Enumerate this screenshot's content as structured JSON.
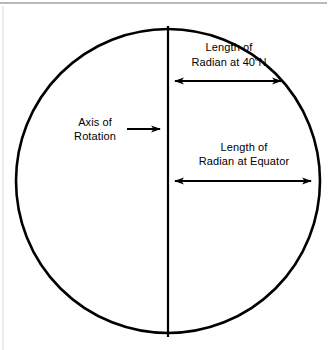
{
  "figure": {
    "background_color": "#ffffff",
    "stroke_color": "#000000",
    "top_rule_color": "#b9b9bd",
    "width": 334,
    "height": 350
  },
  "labels": {
    "axis_of_rotation": {
      "line1": "Axis of",
      "line2": "Rotation"
    },
    "radian_40n": {
      "line1": "Length of",
      "line2_prefix": "Radian at 40",
      "degree_symbol": "º",
      "line2_suffix": "N"
    },
    "radian_equator": {
      "line1": "Length of",
      "line2": "Radian at Equator"
    }
  },
  "geometry": {
    "circle": {
      "center_x": 168,
      "center_y": 181,
      "radius": 152
    },
    "axis_line": {
      "x": 168,
      "y_top": 26,
      "y_bottom": 337
    },
    "arrow_40n": {
      "y": 81,
      "x_start": 168,
      "x_end": 288,
      "heads": "both"
    },
    "arrow_equator": {
      "y": 181,
      "x_start": 168,
      "x_end": 318,
      "heads": "both"
    },
    "arrow_axis_pointer": {
      "y": 129,
      "x_start": 127,
      "x_end": 166,
      "heads": "right"
    }
  }
}
